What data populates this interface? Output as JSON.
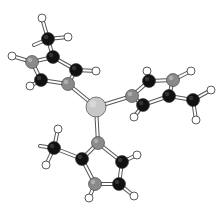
{
  "colors": {
    "background": "#ffffff",
    "carbon": "#111111",
    "nitrogen": "#8a8a8a",
    "hydrogen": "#ffffff",
    "metal": "#c8c8c8",
    "outline": "#333333"
  },
  "atom_types": [
    "metal",
    "nitrogen",
    "carbon",
    "hydrogen"
  ],
  "ligands": [
    {
      "name": "top-left ring",
      "ring_atoms": [
        "C",
        "N",
        "C",
        "N",
        "C"
      ],
      "methyl": true
    },
    {
      "name": "right ring",
      "ring_atoms": [
        "N",
        "C",
        "N",
        "C",
        "C"
      ],
      "methyl": true
    },
    {
      "name": "bottom ring",
      "ring_atoms": [
        "N",
        "C",
        "N",
        "C",
        "C"
      ],
      "methyl": true
    }
  ]
}
